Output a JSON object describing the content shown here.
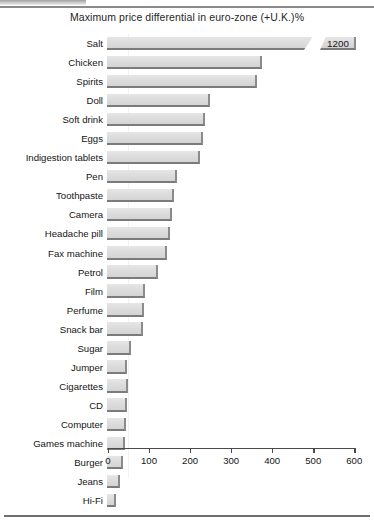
{
  "chart_data": {
    "type": "bar",
    "orientation": "horizontal",
    "title": "Maximum price differential in euro-zone (+U.K.)%",
    "xlabel": "",
    "ylabel": "",
    "xlim": [
      0,
      600
    ],
    "xticks": [
      0,
      100,
      200,
      300,
      400,
      500,
      600
    ],
    "xtick_labels": [
      "0",
      "100",
      "200",
      "300",
      "400",
      "500",
      "600"
    ],
    "grid": false,
    "legend": null,
    "categories": [
      "Salt",
      "Chicken",
      "Spirits",
      "Doll",
      "Soft drink",
      "Eggs",
      "Indigestion tablets",
      "Pen",
      "Toothpaste",
      "Camera",
      "Headache pill",
      "Fax machine",
      "Petrol",
      "Film",
      "Perfume",
      "Snack bar",
      "Sugar",
      "Jumper",
      "Cigarettes",
      "CD",
      "Computer",
      "Games machine",
      "Burger",
      "Jeans",
      "Hi-Fi"
    ],
    "values": [
      1200,
      378,
      366,
      251,
      239,
      234,
      227,
      170,
      163,
      158,
      153,
      146,
      124,
      93,
      90,
      88,
      59,
      49,
      51,
      49,
      46,
      44,
      39,
      32,
      22
    ],
    "annotations": [
      {
        "category": "Salt",
        "label": "1200",
        "note": "bar is broken / truncated; value printed at the axis break"
      }
    ],
    "broken_axis": true,
    "bar_fill_color": "#dddddd",
    "bar_edge_color": "#7b7b7b",
    "background_color": "#ffffff",
    "text_color": "#151515"
  },
  "axis": {
    "tick_labels": [
      "0",
      "100",
      "200",
      "300",
      "400",
      "500",
      "600"
    ]
  }
}
